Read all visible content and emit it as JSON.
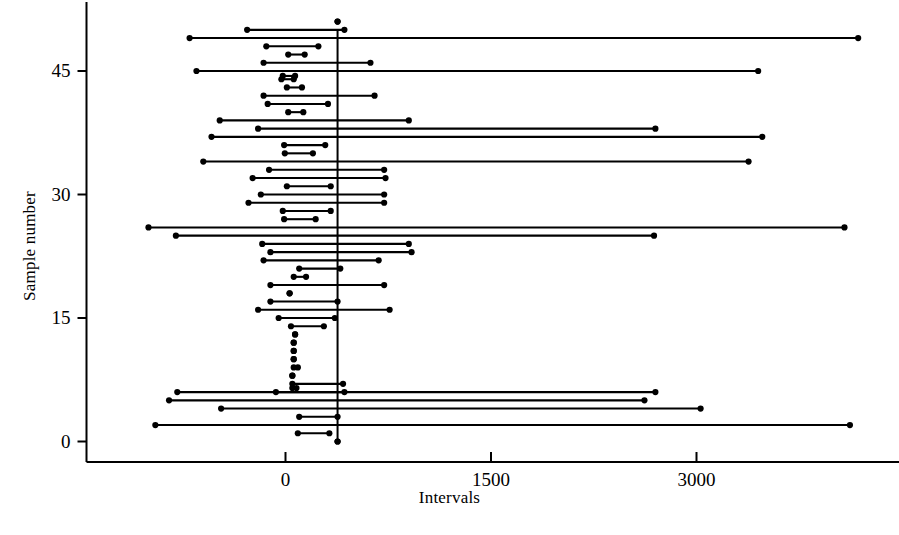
{
  "chart_data": {
    "type": "scatter",
    "subtype": "confidence-interval-plot",
    "title": "",
    "xlabel": "Intervals",
    "ylabel": "Sample number",
    "xlim": [
      -1000,
      4500
    ],
    "ylim": [
      -1.5,
      52
    ],
    "xticks": [
      0,
      1500,
      3000
    ],
    "xticklabels": [
      "0",
      "1500",
      "3000"
    ],
    "yticks": [
      0,
      15,
      30,
      45
    ],
    "yticklabels": [
      "0",
      "15",
      "30",
      "45"
    ],
    "grid": false,
    "legend": null,
    "reference_line": {
      "orientation": "vertical",
      "value": 380,
      "label": ""
    },
    "marker": "filled-circle",
    "series": [
      {
        "name": "interval",
        "description": "Horizontal confidence interval for each sample; endpoints marked with filled circles.",
        "columns": [
          "sample",
          "lower",
          "upper"
        ],
        "values": [
          [
            51,
            380,
            380
          ],
          [
            50,
            -280,
            430
          ],
          [
            49,
            -700,
            4180
          ],
          [
            48,
            -140,
            240
          ],
          [
            47,
            20,
            140
          ],
          [
            46,
            -160,
            620
          ],
          [
            45,
            -650,
            3450
          ],
          [
            44,
            -30,
            60
          ],
          [
            44.4,
            -20,
            70
          ],
          [
            43,
            10,
            120
          ],
          [
            42,
            -160,
            650
          ],
          [
            41,
            -130,
            310
          ],
          [
            40,
            20,
            130
          ],
          [
            39,
            -480,
            900
          ],
          [
            38,
            -200,
            2700
          ],
          [
            37,
            -540,
            3480
          ],
          [
            36,
            -10,
            290
          ],
          [
            35,
            -5,
            200
          ],
          [
            34,
            -600,
            3380
          ],
          [
            33,
            -120,
            720
          ],
          [
            32,
            -240,
            730
          ],
          [
            31,
            10,
            330
          ],
          [
            30,
            -180,
            720
          ],
          [
            29,
            -270,
            720
          ],
          [
            28,
            -20,
            330
          ],
          [
            27,
            -10,
            220
          ],
          [
            26,
            -1000,
            4080
          ],
          [
            25,
            -800,
            2690
          ],
          [
            24,
            -170,
            900
          ],
          [
            23,
            -110,
            920
          ],
          [
            22,
            -160,
            680
          ],
          [
            21,
            100,
            400
          ],
          [
            20,
            60,
            150
          ],
          [
            19,
            -110,
            720
          ],
          [
            18,
            30,
            30
          ],
          [
            17,
            -110,
            380
          ],
          [
            16,
            -200,
            760
          ],
          [
            15,
            -50,
            360
          ],
          [
            14,
            40,
            280
          ],
          [
            13,
            70,
            70
          ],
          [
            12,
            60,
            60
          ],
          [
            11,
            60,
            60
          ],
          [
            10,
            60,
            60
          ],
          [
            9,
            60,
            90
          ],
          [
            8,
            50,
            50
          ],
          [
            7,
            50,
            420
          ],
          [
            6,
            -70,
            430
          ],
          [
            6.5,
            50,
            80
          ],
          [
            6,
            -790,
            2700
          ],
          [
            5,
            -850,
            2620
          ],
          [
            4,
            -470,
            3030
          ],
          [
            3,
            100,
            380
          ],
          [
            2,
            -950,
            4120
          ],
          [
            1,
            90,
            320
          ],
          [
            0,
            380,
            380
          ]
        ]
      }
    ]
  },
  "axes": {
    "x_tick_labels": [
      "0",
      "1500",
      "3000"
    ],
    "y_tick_labels": [
      "0",
      "15",
      "30",
      "45"
    ],
    "x_axis_title": "Intervals",
    "y_axis_title": "Sample number"
  },
  "colors": {
    "line": "#000000",
    "marker": "#000000",
    "axis": "#000000",
    "background": "#ffffff"
  }
}
